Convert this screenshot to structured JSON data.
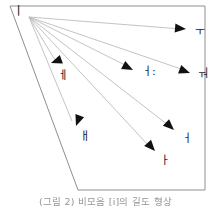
{
  "figure": {
    "caption": "(그림 2) 비모음 [i]의 길도 형상",
    "origin_label": "ㅣ",
    "frame_color": "#8f8f8f",
    "line_color": "#b9b9b9",
    "arrow_color": "#111111",
    "label_color": "#1a1a1a",
    "background": "#ffffff"
  },
  "outline": {
    "name": "vowel-space-quadrilateral",
    "points": "10,6 205,6 205,190 78,190"
  },
  "origin": {
    "x": 29,
    "y": 17,
    "label": "ㅣ",
    "label_x": 13,
    "label_y": 5
  },
  "transitions": [
    {
      "id": "to-u",
      "target_label": "ㅜ",
      "tip_x": 186,
      "tip_y": 29,
      "angle": 5,
      "label_x": 195,
      "label_y": 26
    },
    {
      "id": "to-o",
      "target_label": "ㅝ",
      "tip_x": 190,
      "tip_y": 73,
      "angle": 20,
      "label_x": 198,
      "label_y": 68
    },
    {
      "id": "to-eo-long",
      "target_label": "ㅓ:",
      "tip_x": 133,
      "tip_y": 70,
      "angle": 27,
      "label_x": 142,
      "label_y": 66
    },
    {
      "id": "to-eo",
      "target_label": "ㅓ",
      "tip_x": 174,
      "tip_y": 130,
      "angle": 43,
      "label_x": 182,
      "label_y": 133
    },
    {
      "id": "to-a",
      "target_label": "ㅏ",
      "tip_x": 155,
      "tip_y": 151,
      "angle": 48,
      "label_x": 160,
      "label_y": 155
    },
    {
      "id": "to-e",
      "target_label": "ㅔ",
      "tip_x": 51,
      "tip_y": 63,
      "angle": 60,
      "label_x": 58,
      "label_y": 70
    },
    {
      "id": "to-ae",
      "target_label": "ㅐ",
      "tip_x": 76,
      "tip_y": 126,
      "angle": 54,
      "label_x": 80,
      "label_y": 131
    }
  ]
}
